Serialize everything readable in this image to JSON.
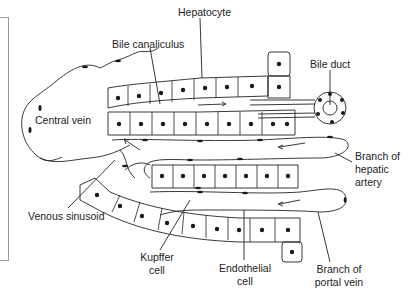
{
  "figure": {
    "labels": {
      "hepatocyte": "Hepatocyte",
      "bile_canaliculus": "Bile canaliculus",
      "bile_duct": "Bile duct",
      "central_vein": "Central vein",
      "hepatic_artery_1": "Branch of",
      "hepatic_artery_2": "hepatic",
      "hepatic_artery_3": "artery",
      "venous_sinusoid": "Venous sinusoid",
      "kupffer_1": "Kupffer",
      "kupffer_2": "cell",
      "endothelial_1": "Endothelial",
      "endothelial_2": "cell",
      "portal_vein_1": "Branch of",
      "portal_vein_2": "portal vein"
    },
    "colors": {
      "line": "#222222",
      "nucleus": "#1a1a1a",
      "frame": "#9a9a9a"
    }
  }
}
